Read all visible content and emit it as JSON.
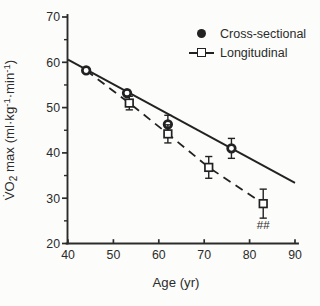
{
  "figure": {
    "background": "#fcfcfa",
    "ink_color": "#2b2b2b"
  },
  "chart_data": {
    "type": "line",
    "title": "",
    "xlabel": "Age (yr)",
    "ylabel": "V̇O₂ max (ml·kg⁻¹·min⁻¹)",
    "ylabel_parts": [
      {
        "t": "V̇O"
      },
      {
        "t": "2",
        "s": "sub"
      },
      {
        "t": " max (ml·kg"
      },
      {
        "t": "-1",
        "s": "sup"
      },
      {
        "t": "·min"
      },
      {
        "t": "-1",
        "s": "sup"
      },
      {
        "t": ")"
      }
    ],
    "xlim": [
      40,
      90
    ],
    "ylim": [
      20,
      70
    ],
    "x_ticks": [
      40,
      50,
      60,
      70,
      80,
      90
    ],
    "y_ticks": [
      70,
      60,
      50,
      40,
      30,
      20
    ],
    "y_minor_ticks": [
      65,
      55,
      45,
      35,
      25
    ],
    "grid": false,
    "legend_position": "top-right",
    "series": [
      {
        "name": "Cross-sectional",
        "marker": "filled-circle",
        "line_style": "solid",
        "color": "#222222",
        "points": [
          {
            "x": 44,
            "y": 58.2
          },
          {
            "x": 53,
            "y": 53.2
          },
          {
            "x": 62,
            "y": 46.3,
            "err": 2.0
          },
          {
            "x": 76,
            "y": 41.0,
            "err": 2.2
          }
        ],
        "regression_line": {
          "x1": 40,
          "y1": 60.6,
          "x2": 90,
          "y2": 33.4
        }
      },
      {
        "name": "Longitudinal",
        "marker": "open-square",
        "line_style": "dashed",
        "color": "#222222",
        "points": [
          {
            "x": 44,
            "y": 58.2,
            "hide_marker": true
          },
          {
            "x": 53.5,
            "y": 51.0,
            "err": 1.5
          },
          {
            "x": 62,
            "y": 44.2,
            "err": 2.0
          },
          {
            "x": 71,
            "y": 36.8,
            "err": 2.4
          },
          {
            "x": 83,
            "y": 28.8,
            "err": 3.2
          }
        ]
      }
    ],
    "annotations": [
      {
        "text": "##",
        "x": 83,
        "y": 23.2
      }
    ]
  }
}
